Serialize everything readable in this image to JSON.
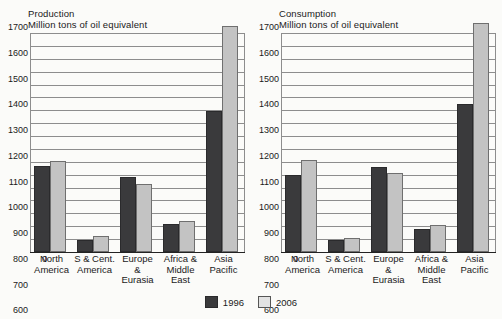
{
  "chart_data": [
    {
      "type": "bar",
      "title": "Production",
      "subtitle": "Million tons of oil equivalent",
      "ylabel": "Million tons of oil equivalent",
      "xlabel": "",
      "ylim": [
        0,
        1700
      ],
      "ytick_step": 100,
      "yticks": [
        1700,
        1600,
        1500,
        1400,
        1300,
        1200,
        1100,
        1000,
        900,
        800,
        700,
        600,
        500,
        400,
        300,
        200,
        100,
        0
      ],
      "grid": true,
      "legend_position": "bottom-center",
      "categories": [
        "North America",
        "S & Cent. America",
        "Europe & Eurasia",
        "Africa & Middle East",
        "Asia Pacific"
      ],
      "series": [
        {
          "name": "1996",
          "color": "#3a3a3c",
          "values": [
            650,
            80,
            570,
            200,
            1080
          ]
        },
        {
          "name": "2006",
          "color": "#c3c3c3",
          "values": [
            690,
            110,
            510,
            225,
            1740
          ]
        }
      ]
    },
    {
      "type": "bar",
      "title": "Consumption",
      "subtitle": "Million tons of oil equivalent",
      "ylabel": "Million tons of oil equivalent",
      "xlabel": "",
      "ylim": [
        0,
        1700
      ],
      "ytick_step": 100,
      "yticks": [
        1700,
        1600,
        1500,
        1400,
        1300,
        1200,
        1100,
        1000,
        900,
        800,
        700,
        600,
        500,
        400,
        300,
        200,
        100,
        0
      ],
      "grid": true,
      "legend_position": "bottom-center",
      "categories": [
        "North America",
        "S & Cent. America",
        "Europe & Eurasia",
        "Africa & Middle East",
        "Asia Pacific"
      ],
      "series": [
        {
          "name": "1996",
          "color": "#3a3a3c",
          "values": [
            580,
            75,
            645,
            160,
            1130
          ]
        },
        {
          "name": "2006",
          "color": "#c3c3c3",
          "values": [
            700,
            95,
            595,
            195,
            1760
          ]
        }
      ]
    }
  ],
  "panels": [
    {
      "title": "Production",
      "subtitle": "Million tons of oil equivalent",
      "zero_label": "0",
      "xlabels": [
        "North\nAmerica",
        "S & Cent.\nAmerica",
        "Europe\n&\nEurasia",
        "Africa &\nMiddle\nEast",
        "Asia\nPacific"
      ]
    },
    {
      "title": "Consumption",
      "subtitle": "Million tons of oil equivalent",
      "zero_label": "0",
      "xlabels": [
        "North\nAmerica",
        "S & Cent.\nAmerica",
        "Europe\n&\nEurasia",
        "Africa &\nMiddle\nEast",
        "Asia\nPacific"
      ]
    }
  ],
  "legend": {
    "items": [
      {
        "label": "1996",
        "color": "#3a3a3c"
      },
      {
        "label": "2006",
        "color": "#e2e2e2"
      }
    ]
  }
}
